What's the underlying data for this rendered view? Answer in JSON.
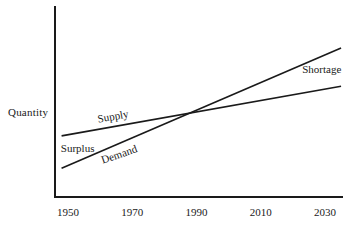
{
  "chart_data": {
    "type": "line",
    "title": "",
    "xlabel": "",
    "ylabel": "Quantity",
    "x_ticks": [
      "1950",
      "1970",
      "1990",
      "2010",
      "2030"
    ],
    "x_tick_years": [
      1950,
      1970,
      1990,
      2010,
      2030
    ],
    "x_range": [
      1948,
      2035
    ],
    "y_range": [
      0,
      100
    ],
    "grid": false,
    "legend": "inline-labels",
    "line_color": "#1a1a1a",
    "axis_color": "#1a1a1a",
    "background_color": "#ffffff",
    "series": [
      {
        "name": "Supply",
        "x": [
          1948,
          2035
        ],
        "values": [
          32,
          58
        ]
      },
      {
        "name": "Demand",
        "x": [
          1948,
          2035
        ],
        "values": [
          15,
          78
        ]
      }
    ],
    "intersection": {
      "year": 1988,
      "value": 44
    },
    "labels": [
      {
        "text": "Supply",
        "year": 1964,
        "value": 42.5,
        "rotation": -10
      },
      {
        "text": "Demand",
        "year": 1966,
        "value": 22.5,
        "rotation": -19
      },
      {
        "text": "Surplus",
        "year": 1953,
        "value": 25.5,
        "rotation": 0
      },
      {
        "text": "Shortage",
        "year": 2029,
        "value": 67.0,
        "rotation": 0
      }
    ]
  }
}
